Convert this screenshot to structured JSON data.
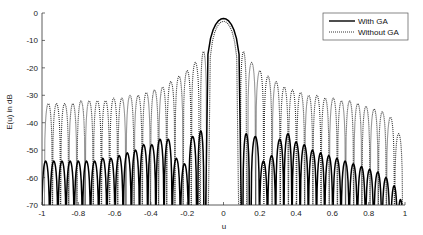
{
  "chart_data": {
    "type": "line",
    "title": "",
    "xlabel": "u",
    "ylabel": "E(u) in dB",
    "xlim": [
      -1,
      1
    ],
    "ylim": [
      -70,
      0
    ],
    "xticks": [
      -1,
      -0.8,
      -0.6,
      -0.4,
      -0.2,
      0,
      0.2,
      0.4,
      0.6,
      0.8,
      1
    ],
    "xtick_labels": [
      "-1",
      "-0.8",
      "-0.6",
      "-0.4",
      "-0.2",
      "0",
      "0.2",
      "0.4",
      "0.6",
      "0.8",
      "1"
    ],
    "yticks": [
      0,
      -10,
      -20,
      -30,
      -40,
      -50,
      -60,
      -70
    ],
    "ytick_labels": [
      "0",
      "-10",
      "-20",
      "-30",
      "-40",
      "-50",
      "-60",
      "-70"
    ],
    "grid": false,
    "legend_position": "upper right",
    "series": [
      {
        "name": "With GA",
        "style": "solid",
        "color": "#000000",
        "mainlobe": {
          "peak_u": 0,
          "peak_db": -2,
          "null_left_u": -0.1,
          "null_right_u": 0.1
        },
        "sidelobe_peaks_right": [
          {
            "u": 0.125,
            "db": -44
          },
          {
            "u": 0.175,
            "db": -45
          },
          {
            "u": 0.22,
            "db": -54
          },
          {
            "u": 0.265,
            "db": -52
          },
          {
            "u": 0.31,
            "db": -46
          },
          {
            "u": 0.355,
            "db": -44
          },
          {
            "u": 0.4,
            "db": -47
          },
          {
            "u": 0.445,
            "db": -48
          },
          {
            "u": 0.49,
            "db": -50
          },
          {
            "u": 0.535,
            "db": -51
          },
          {
            "u": 0.58,
            "db": -52
          },
          {
            "u": 0.625,
            "db": -53
          },
          {
            "u": 0.67,
            "db": -54
          },
          {
            "u": 0.715,
            "db": -55
          },
          {
            "u": 0.76,
            "db": -56
          },
          {
            "u": 0.805,
            "db": -57
          },
          {
            "u": 0.85,
            "db": -58
          },
          {
            "u": 0.895,
            "db": -60
          },
          {
            "u": 0.94,
            "db": -63
          },
          {
            "u": 0.975,
            "db": -68
          }
        ],
        "sidelobe_peaks_left": [
          {
            "u": -0.125,
            "db": -43
          },
          {
            "u": -0.17,
            "db": -45
          },
          {
            "u": -0.215,
            "db": -55
          },
          {
            "u": -0.26,
            "db": -53
          },
          {
            "u": -0.305,
            "db": -46
          },
          {
            "u": -0.35,
            "db": -46
          },
          {
            "u": -0.395,
            "db": -48
          },
          {
            "u": -0.44,
            "db": -48
          },
          {
            "u": -0.485,
            "db": -50
          },
          {
            "u": -0.53,
            "db": -51
          },
          {
            "u": -0.575,
            "db": -52
          },
          {
            "u": -0.62,
            "db": -53
          },
          {
            "u": -0.665,
            "db": -53
          },
          {
            "u": -0.71,
            "db": -54
          },
          {
            "u": -0.755,
            "db": -54
          },
          {
            "u": -0.8,
            "db": -54
          },
          {
            "u": -0.845,
            "db": -54
          },
          {
            "u": -0.89,
            "db": -54
          },
          {
            "u": -0.935,
            "db": -54
          },
          {
            "u": -0.98,
            "db": -54
          }
        ]
      },
      {
        "name": "Without GA",
        "style": "dotted",
        "color": "#333333",
        "mainlobe": {
          "peak_u": 0,
          "peak_db": -3,
          "null_left_u": -0.085,
          "null_right_u": 0.085
        },
        "sidelobe_peaks_right": [
          {
            "u": 0.11,
            "db": -14
          },
          {
            "u": 0.155,
            "db": -18
          },
          {
            "u": 0.2,
            "db": -21
          },
          {
            "u": 0.245,
            "db": -23
          },
          {
            "u": 0.29,
            "db": -25
          },
          {
            "u": 0.335,
            "db": -27
          },
          {
            "u": 0.38,
            "db": -28
          },
          {
            "u": 0.425,
            "db": -29
          },
          {
            "u": 0.47,
            "db": -30
          },
          {
            "u": 0.515,
            "db": -30
          },
          {
            "u": 0.56,
            "db": -31
          },
          {
            "u": 0.605,
            "db": -31
          },
          {
            "u": 0.65,
            "db": -32
          },
          {
            "u": 0.695,
            "db": -32
          },
          {
            "u": 0.74,
            "db": -33
          },
          {
            "u": 0.785,
            "db": -34
          },
          {
            "u": 0.83,
            "db": -35
          },
          {
            "u": 0.875,
            "db": -36
          },
          {
            "u": 0.92,
            "db": -38
          },
          {
            "u": 0.965,
            "db": -44
          }
        ],
        "sidelobe_peaks_left": [
          {
            "u": -0.11,
            "db": -14
          },
          {
            "u": -0.155,
            "db": -18
          },
          {
            "u": -0.2,
            "db": -21
          },
          {
            "u": -0.245,
            "db": -23
          },
          {
            "u": -0.29,
            "db": -25
          },
          {
            "u": -0.335,
            "db": -27
          },
          {
            "u": -0.38,
            "db": -28
          },
          {
            "u": -0.425,
            "db": -29
          },
          {
            "u": -0.47,
            "db": -30
          },
          {
            "u": -0.515,
            "db": -30
          },
          {
            "u": -0.56,
            "db": -31
          },
          {
            "u": -0.605,
            "db": -31
          },
          {
            "u": -0.65,
            "db": -32
          },
          {
            "u": -0.695,
            "db": -32
          },
          {
            "u": -0.74,
            "db": -32
          },
          {
            "u": -0.785,
            "db": -32
          },
          {
            "u": -0.83,
            "db": -33
          },
          {
            "u": -0.875,
            "db": -33
          },
          {
            "u": -0.92,
            "db": -33
          },
          {
            "u": -0.965,
            "db": -33
          }
        ]
      }
    ]
  },
  "legend": {
    "items": [
      {
        "label": "With GA",
        "style": "solid"
      },
      {
        "label": "Without GA",
        "style": "dotted"
      }
    ]
  },
  "axes": {
    "xlabel": "u",
    "ylabel": "E(u) in dB"
  }
}
